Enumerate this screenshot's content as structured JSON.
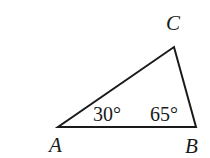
{
  "diagram": {
    "type": "triangle",
    "stroke_color": "#1a1a1a",
    "vertices": [
      {
        "name": "A",
        "label": "A"
      },
      {
        "name": "B",
        "label": "B"
      },
      {
        "name": "C",
        "label": "C"
      }
    ],
    "angles": [
      {
        "vertex": "A",
        "label": "30°"
      },
      {
        "vertex": "B",
        "label": "65°"
      }
    ]
  }
}
